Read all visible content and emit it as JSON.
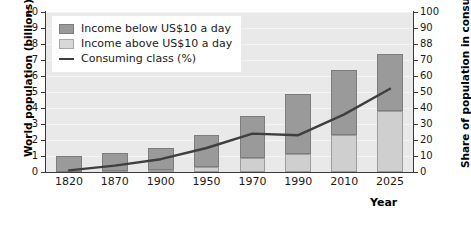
{
  "chart_data": {
    "type": "bar",
    "title": "",
    "xlabel": "Year",
    "ylabel": "World population (billions)",
    "y2label": "Share of population in consuming class (%)",
    "categories": [
      "1820",
      "1870",
      "1900",
      "1950",
      "1970",
      "1990",
      "2010",
      "2025"
    ],
    "ylim": [
      0,
      10
    ],
    "y2lim": [
      0,
      100
    ],
    "yticks": [
      "0",
      "1",
      "2",
      "3",
      "4",
      "5",
      "6",
      "7",
      "8",
      "9",
      "10"
    ],
    "y2ticks": [
      "0",
      "10",
      "20",
      "30",
      "40",
      "50",
      "60",
      "70",
      "88",
      "90",
      "100"
    ],
    "grid": true,
    "legend_position": "upper-left",
    "series": [
      {
        "name": "Income above US$10 a day",
        "type": "bar-stack-bottom",
        "color": "#cfcfcf",
        "values": [
          0.02,
          0.05,
          0.15,
          0.3,
          0.9,
          1.1,
          2.3,
          3.8
        ]
      },
      {
        "name": "Income below US$10 a day",
        "type": "bar-stack-top",
        "color": "#9a9a9a",
        "values": [
          0.98,
          1.15,
          1.35,
          2.0,
          2.6,
          3.8,
          4.1,
          3.6
        ]
      },
      {
        "name": "Consuming class (%)",
        "type": "line",
        "color": "#3f3f3f",
        "values": [
          1,
          4,
          8,
          15,
          24,
          23,
          36,
          52
        ]
      }
    ],
    "bar_totals": [
      1.0,
      1.2,
      1.5,
      2.3,
      3.5,
      4.9,
      6.4,
      7.4
    ]
  },
  "legend": {
    "items": [
      {
        "label": "Income below US$10 a day",
        "swatch": "below"
      },
      {
        "label": "Income above US$10 a day",
        "swatch": "above"
      },
      {
        "label": "Consuming class (%)",
        "swatch": "line"
      }
    ]
  },
  "axes": {
    "left_title": "World population (billions)",
    "right_title": "Share of population in consuming class (%)",
    "x_title": "Year"
  }
}
